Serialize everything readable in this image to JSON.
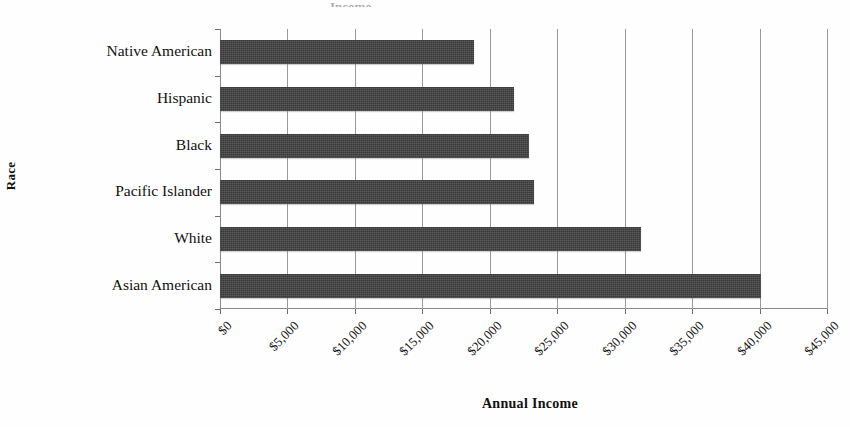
{
  "chart_data": {
    "type": "bar",
    "orientation": "horizontal",
    "title": "",
    "title_remnant": "Income",
    "xlabel": "Annual Income",
    "ylabel": "Race",
    "categories": [
      "Native American",
      "Hispanic",
      "Black",
      "Pacific Islander",
      "White",
      "Asian American"
    ],
    "values": [
      18800,
      21800,
      22900,
      23300,
      31200,
      40100
    ],
    "xlim": [
      0,
      45000
    ],
    "xticks": [
      0,
      5000,
      10000,
      15000,
      20000,
      25000,
      30000,
      35000,
      40000,
      45000
    ],
    "xtick_labels": [
      "$0",
      "$5,000",
      "$10,000",
      "$15,000",
      "$20,000",
      "$25,000",
      "$30,000",
      "$35,000",
      "$40,000",
      "$45,000"
    ],
    "grid": true,
    "grid_axis": "x",
    "legend": false,
    "bar_color": "#383838",
    "gridline_color": "#9a9a9a",
    "axis_color": "#8a8a8a",
    "background_color": "#ffffff",
    "xtick_label_rotation": -45
  }
}
